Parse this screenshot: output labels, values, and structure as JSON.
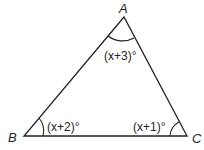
{
  "diagram": {
    "type": "triangle",
    "vertices": [
      {
        "name": "A",
        "label": "A",
        "x": 124,
        "y": 17
      },
      {
        "name": "B",
        "label": "B",
        "x": 24,
        "y": 136
      },
      {
        "name": "C",
        "label": "C",
        "x": 187,
        "y": 136
      }
    ],
    "angles": [
      {
        "vertex": "A",
        "label": "(x+3)°"
      },
      {
        "vertex": "B",
        "label": "(x+2)°"
      },
      {
        "vertex": "C",
        "label": "(x+1)°"
      }
    ],
    "colors": {
      "stroke": "#222222",
      "background": "#ffffff"
    }
  }
}
